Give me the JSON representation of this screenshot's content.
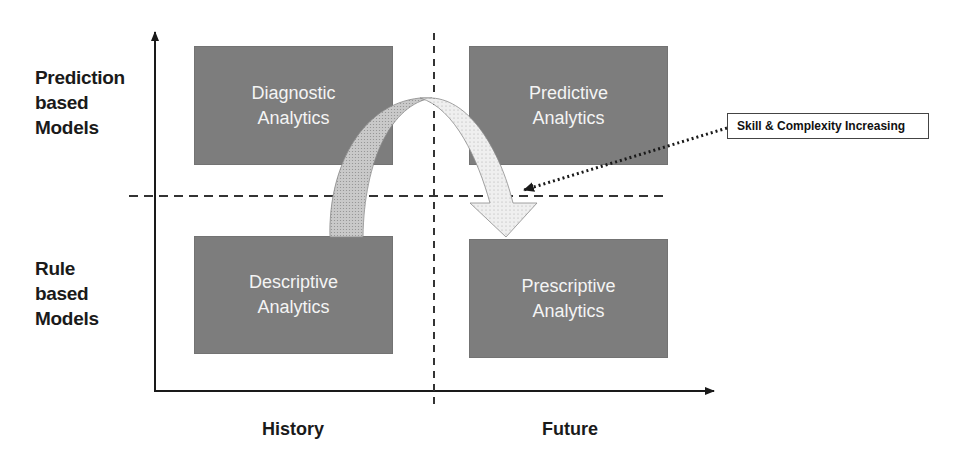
{
  "diagram": {
    "type": "quadrant",
    "y_axis_labels": {
      "top": [
        "Prediction",
        "based",
        "Models"
      ],
      "bottom": [
        "Rule",
        "based",
        "Models"
      ]
    },
    "x_axis_labels": {
      "left": "History",
      "right": "Future"
    },
    "quadrants": [
      {
        "id": "diagnostic",
        "position": "top-left",
        "lines": [
          "Diagnostic",
          "Analytics"
        ]
      },
      {
        "id": "predictive",
        "position": "top-right",
        "lines": [
          "Predictive",
          "Analytics"
        ]
      },
      {
        "id": "descriptive",
        "position": "bottom-left",
        "lines": [
          "Descriptive",
          "Analytics"
        ]
      },
      {
        "id": "prescriptive",
        "position": "bottom-right",
        "lines": [
          "Prescriptive",
          "Analytics"
        ]
      }
    ],
    "arc_arrow": {
      "from": "descriptive",
      "to": "prescriptive"
    },
    "callout": {
      "text": "Skill & Complexity Increasing",
      "points_to": "arc_arrow"
    },
    "colors": {
      "box_fill": "#7d7d7d",
      "box_text": "#f4f4f4",
      "arrow_left_fill": "#c4c4c4",
      "arrow_right_fill": "#ececec",
      "axis": "#1a1a1a"
    }
  }
}
